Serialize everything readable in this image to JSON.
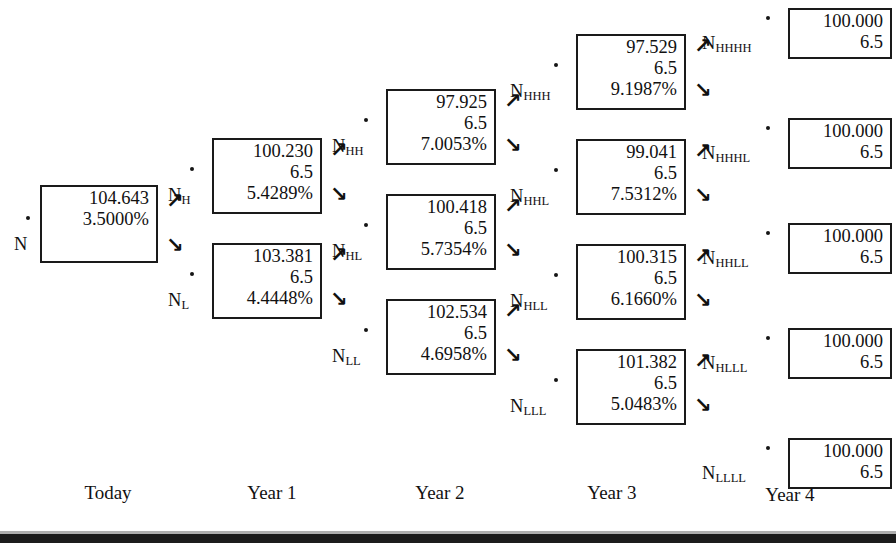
{
  "figure": {
    "type": "binomial-interest-rate-tree",
    "top_remnant_text": "",
    "arrow_up_glyph": "↗",
    "arrow_down_glyph": "↘",
    "ink_color": "#1a1a1a"
  },
  "timeline": [
    {
      "label": "Today",
      "x": 108
    },
    {
      "label": "Year 1",
      "x": 272
    },
    {
      "label": "Year 2",
      "x": 440
    },
    {
      "label": "Year 3",
      "x": 612
    },
    {
      "label": "Year 4",
      "x": 790
    }
  ],
  "nodes": [
    {
      "id": "N",
      "name": "N",
      "sub": "",
      "value": "104.643",
      "coupon": "",
      "rate": "3.5000%",
      "x": 40,
      "y": 185,
      "w": 118,
      "h": 78,
      "label_x": -26,
      "label_y": 49,
      "dot_x": -14,
      "dot_y": 31,
      "arrow_up_x": 126,
      "arrow_up_y": 6,
      "arrow_down_x": 126,
      "arrow_down_y": 50,
      "terminal": false
    },
    {
      "id": "NH",
      "name": "N",
      "sub": "H",
      "value": "100.230",
      "coupon": "6.5",
      "rate": "5.4289%",
      "x": 212,
      "y": 138,
      "w": 110,
      "h": 76,
      "label_x": -44,
      "label_y": 47,
      "dot_x": -22,
      "dot_y": 29,
      "arrow_up_x": 118,
      "arrow_up_y": 2,
      "arrow_down_x": 118,
      "arrow_down_y": 46,
      "terminal": false
    },
    {
      "id": "NL",
      "name": "N",
      "sub": "L",
      "value": "103.381",
      "coupon": "6.5",
      "rate": "4.4448%",
      "x": 212,
      "y": 243,
      "w": 110,
      "h": 76,
      "label_x": -44,
      "label_y": 47,
      "dot_x": -22,
      "dot_y": 29,
      "arrow_up_x": 118,
      "arrow_up_y": 2,
      "arrow_down_x": 118,
      "arrow_down_y": 46,
      "terminal": false
    },
    {
      "id": "NHH",
      "name": "N",
      "sub": "HH",
      "value": "97.925",
      "coupon": "6.5",
      "rate": "7.0053%",
      "x": 386,
      "y": 89,
      "w": 110,
      "h": 76,
      "label_x": -54,
      "label_y": 47,
      "dot_x": -22,
      "dot_y": 29,
      "arrow_up_x": 118,
      "arrow_up_y": 2,
      "arrow_down_x": 118,
      "arrow_down_y": 46,
      "terminal": false
    },
    {
      "id": "NHL",
      "name": "N",
      "sub": "HL",
      "value": "100.418",
      "coupon": "6.5",
      "rate": "5.7354%",
      "x": 386,
      "y": 194,
      "w": 110,
      "h": 76,
      "label_x": -54,
      "label_y": 47,
      "dot_x": -22,
      "dot_y": 29,
      "arrow_up_x": 118,
      "arrow_up_y": 2,
      "arrow_down_x": 118,
      "arrow_down_y": 46,
      "terminal": false
    },
    {
      "id": "NLL",
      "name": "N",
      "sub": "LL",
      "value": "102.534",
      "coupon": "6.5",
      "rate": "4.6958%",
      "x": 386,
      "y": 299,
      "w": 110,
      "h": 76,
      "label_x": -54,
      "label_y": 47,
      "dot_x": -22,
      "dot_y": 29,
      "arrow_up_x": 118,
      "arrow_up_y": 2,
      "arrow_down_x": 118,
      "arrow_down_y": 46,
      "terminal": false
    },
    {
      "id": "NHHH",
      "name": "N",
      "sub": "HHH",
      "value": "97.529",
      "coupon": "6.5",
      "rate": "9.1987%",
      "x": 576,
      "y": 34,
      "w": 110,
      "h": 76,
      "label_x": -66,
      "label_y": 47,
      "dot_x": -22,
      "dot_y": 29,
      "arrow_up_x": 118,
      "arrow_up_y": 2,
      "arrow_down_x": 118,
      "arrow_down_y": 46,
      "terminal": false
    },
    {
      "id": "NHHL",
      "name": "N",
      "sub": "HHL",
      "value": "99.041",
      "coupon": "6.5",
      "rate": "7.5312%",
      "x": 576,
      "y": 139,
      "w": 110,
      "h": 76,
      "label_x": -66,
      "label_y": 47,
      "dot_x": -22,
      "dot_y": 29,
      "arrow_up_x": 118,
      "arrow_up_y": 2,
      "arrow_down_x": 118,
      "arrow_down_y": 46,
      "terminal": false
    },
    {
      "id": "NHLL",
      "name": "N",
      "sub": "HLL",
      "value": "100.315",
      "coupon": "6.5",
      "rate": "6.1660%",
      "x": 576,
      "y": 244,
      "w": 110,
      "h": 76,
      "label_x": -66,
      "label_y": 47,
      "dot_x": -22,
      "dot_y": 29,
      "arrow_up_x": 118,
      "arrow_up_y": 2,
      "arrow_down_x": 118,
      "arrow_down_y": 46,
      "terminal": false
    },
    {
      "id": "NLLL",
      "name": "N",
      "sub": "LLL",
      "value": "101.382",
      "coupon": "6.5",
      "rate": "5.0483%",
      "x": 576,
      "y": 349,
      "w": 110,
      "h": 76,
      "label_x": -66,
      "label_y": 47,
      "dot_x": -22,
      "dot_y": 29,
      "arrow_up_x": 118,
      "arrow_up_y": 2,
      "arrow_down_x": 118,
      "arrow_down_y": 46,
      "terminal": false
    },
    {
      "id": "NHHHH",
      "name": "N",
      "sub": "HHHH",
      "value": "100.000",
      "coupon": "6.5",
      "rate": "",
      "x": 788,
      "y": 8,
      "w": 104,
      "h": 51,
      "label_x": -86,
      "label_y": 25,
      "dot_x": -22,
      "dot_y": 8,
      "arrow_up_x": 0,
      "arrow_up_y": 0,
      "arrow_down_x": 0,
      "arrow_down_y": 0,
      "terminal": true
    },
    {
      "id": "NHHHL",
      "name": "N",
      "sub": "HHHL",
      "value": "100.000",
      "coupon": "6.5",
      "rate": "",
      "x": 788,
      "y": 118,
      "w": 104,
      "h": 51,
      "label_x": -86,
      "label_y": 25,
      "dot_x": -22,
      "dot_y": 8,
      "arrow_up_x": 0,
      "arrow_up_y": 0,
      "arrow_down_x": 0,
      "arrow_down_y": 0,
      "terminal": true
    },
    {
      "id": "NHHLL",
      "name": "N",
      "sub": "HHLL",
      "value": "100.000",
      "coupon": "6.5",
      "rate": "",
      "x": 788,
      "y": 223,
      "w": 104,
      "h": 51,
      "label_x": -86,
      "label_y": 25,
      "dot_x": -22,
      "dot_y": 8,
      "arrow_up_x": 0,
      "arrow_up_y": 0,
      "arrow_down_x": 0,
      "arrow_down_y": 0,
      "terminal": true
    },
    {
      "id": "NHLLL",
      "name": "N",
      "sub": "HLLL",
      "value": "100.000",
      "coupon": "6.5",
      "rate": "",
      "x": 788,
      "y": 328,
      "w": 104,
      "h": 51,
      "label_x": -86,
      "label_y": 25,
      "dot_x": -22,
      "dot_y": 8,
      "arrow_up_x": 0,
      "arrow_up_y": 0,
      "arrow_down_x": 0,
      "arrow_down_y": 0,
      "terminal": true
    },
    {
      "id": "NLLLL",
      "name": "N",
      "sub": "LLLL",
      "value": "100.000",
      "coupon": "6.5",
      "rate": "",
      "x": 788,
      "y": 438,
      "w": 104,
      "h": 51,
      "label_x": -86,
      "label_y": 25,
      "dot_x": -22,
      "dot_y": 8,
      "arrow_up_x": 0,
      "arrow_up_y": 0,
      "arrow_down_x": 0,
      "arrow_down_y": 0,
      "terminal": true
    }
  ]
}
